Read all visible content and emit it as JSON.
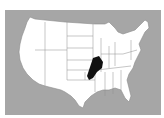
{
  "map": {
    "title": "",
    "region": "United States (contiguous)",
    "background_color": "#a6a6a6",
    "land_color": "#ffffff",
    "border_color": "#8c8c8c",
    "highlight_color": "#111111",
    "highlighted_region": "Ozark region (Missouri / Arkansas)"
  }
}
